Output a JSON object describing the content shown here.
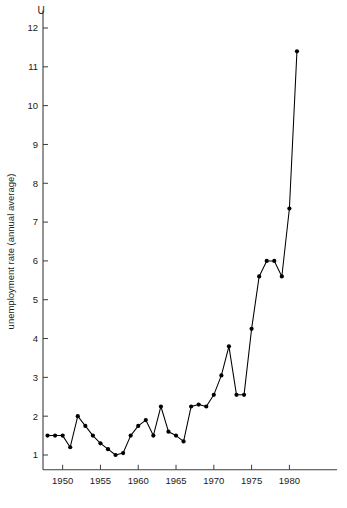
{
  "chart_data": {
    "type": "line",
    "title": "",
    "corner_label": "U",
    "xlabel": "",
    "ylabel": "unemployment rate (annual average)",
    "xlim": [
      1947.4,
      1981.8
    ],
    "ylim": [
      0.55,
      12.3
    ],
    "grid": false,
    "legend": null,
    "marker": "filled-circle",
    "x_ticks": [
      1950,
      1955,
      1960,
      1965,
      1970,
      1975,
      1980
    ],
    "x_tick_labels": [
      "1950",
      "1955",
      "1960",
      "1965",
      "1970",
      "1975",
      "1980"
    ],
    "y_ticks": [
      1,
      2,
      3,
      4,
      5,
      6,
      7,
      8,
      9,
      10,
      11,
      12
    ],
    "y_tick_labels": [
      "1",
      "2",
      "3",
      "4",
      "5",
      "6",
      "7",
      "8",
      "9",
      "10",
      "11",
      "12"
    ],
    "x": [
      1948,
      1949,
      1950,
      1951,
      1952,
      1953,
      1954,
      1955,
      1956,
      1957,
      1958,
      1959,
      1960,
      1961,
      1962,
      1963,
      1964,
      1965,
      1966,
      1967,
      1968,
      1969,
      1970,
      1971,
      1972,
      1973,
      1974,
      1975,
      1976,
      1977,
      1978,
      1979,
      1980,
      1981
    ],
    "values": [
      1.5,
      1.5,
      1.5,
      1.2,
      2.0,
      1.75,
      1.5,
      1.3,
      1.15,
      1.0,
      1.05,
      1.5,
      1.75,
      1.9,
      1.5,
      2.25,
      1.6,
      1.5,
      1.35,
      2.25,
      2.3,
      2.25,
      2.55,
      3.05,
      3.8,
      2.55,
      2.55,
      4.25,
      5.6,
      6.0,
      6.0,
      5.6,
      7.35,
      11.4
    ],
    "series": [
      {
        "name": "unemployment rate (annual average)",
        "values": [
          1.5,
          1.5,
          1.5,
          1.2,
          2.0,
          1.75,
          1.5,
          1.3,
          1.15,
          1.0,
          1.05,
          1.5,
          1.75,
          1.9,
          1.5,
          2.25,
          1.6,
          1.5,
          1.35,
          2.25,
          2.3,
          2.25,
          2.55,
          3.05,
          3.8,
          2.55,
          2.55,
          4.25,
          5.6,
          6.0,
          6.0,
          5.6,
          7.35,
          11.4
        ]
      }
    ]
  }
}
